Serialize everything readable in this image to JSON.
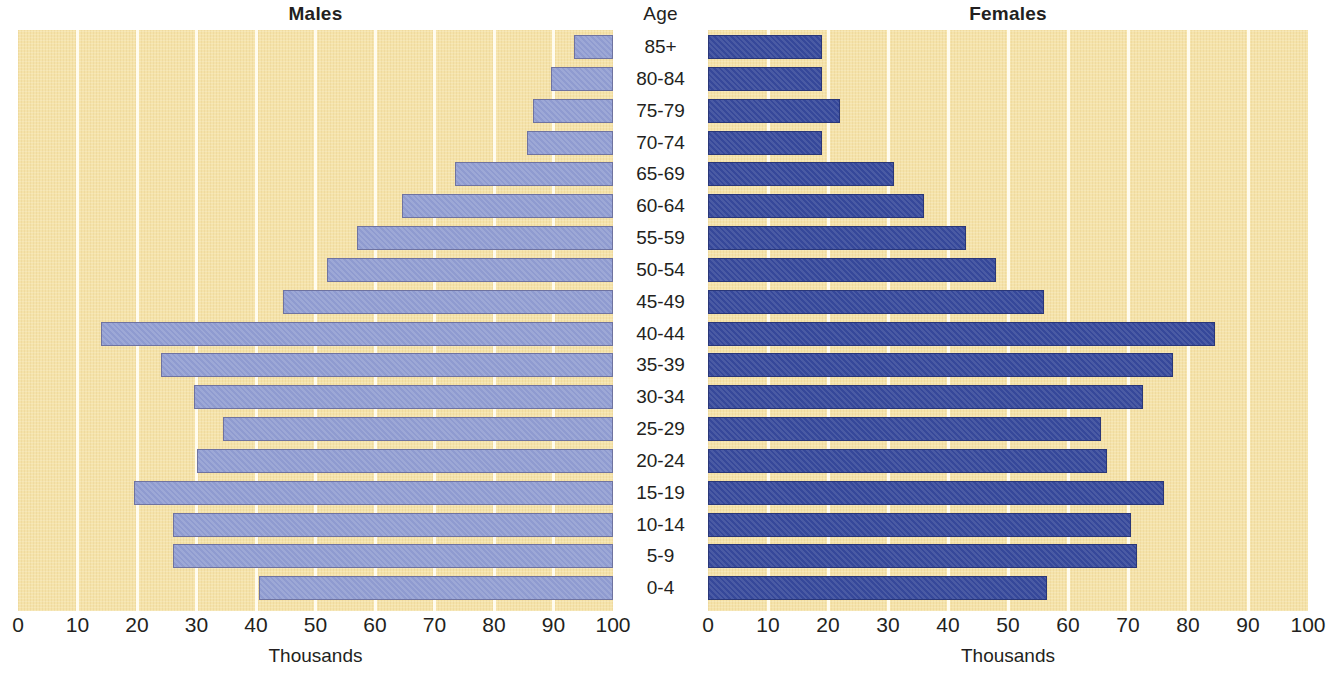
{
  "header": {
    "males_title": "Males",
    "age_title": "Age",
    "females_title": "Females"
  },
  "axis": {
    "caption_left": "Thousands",
    "caption_right": "Thousands",
    "left_ticks": [
      "100",
      "90",
      "80",
      "70",
      "60",
      "50",
      "40",
      "30",
      "20",
      "10",
      "0"
    ],
    "right_ticks": [
      "0",
      "10",
      "20",
      "30",
      "40",
      "50",
      "60",
      "70",
      "80",
      "90",
      "100"
    ]
  },
  "colors": {
    "panel_background": "#f5e3aa",
    "gridline": "#fffdf2",
    "male_bar": "#8f9bd0",
    "male_bar_border": "#6f73a0",
    "female_bar": "#36489a",
    "female_bar_border": "#2a3778",
    "text": "#231f20"
  },
  "chart_data": {
    "type": "bar",
    "subtitle": "",
    "xlabel": "Thousands",
    "ylabel": "Age",
    "orientation": "horizontal",
    "layout": "population-pyramid",
    "xlim": [
      0,
      100
    ],
    "xticks": [
      0,
      10,
      20,
      30,
      40,
      50,
      60,
      70,
      80,
      90,
      100
    ],
    "grid": true,
    "legend_position": "none",
    "categories": [
      "85+",
      "80-84",
      "75-79",
      "70-74",
      "65-69",
      "60-64",
      "55-59",
      "50-54",
      "45-49",
      "40-44",
      "35-39",
      "30-34",
      "25-29",
      "20-24",
      "15-19",
      "10-14",
      "5-9",
      "0-4"
    ],
    "series": [
      {
        "name": "Males",
        "side": "left",
        "units": "thousands",
        "values": [
          6.5,
          10.5,
          13.5,
          14.5,
          26.5,
          35.5,
          43.0,
          48.0,
          55.5,
          86.0,
          76.0,
          70.5,
          65.5,
          70.0,
          80.5,
          74.0,
          74.0,
          59.5
        ]
      },
      {
        "name": "Females",
        "side": "right",
        "units": "thousands",
        "values": [
          19.0,
          19.0,
          22.0,
          19.0,
          31.0,
          36.0,
          43.0,
          48.0,
          56.0,
          84.5,
          77.5,
          72.5,
          65.5,
          66.5,
          76.0,
          70.5,
          71.5,
          56.5
        ]
      }
    ]
  }
}
